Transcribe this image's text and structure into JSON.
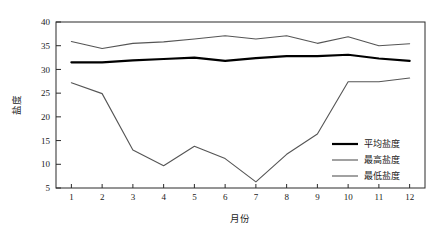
{
  "chart_data": {
    "type": "line",
    "title": "",
    "xlabel": "月份",
    "ylabel": "盐度",
    "x": [
      1,
      2,
      3,
      4,
      5,
      6,
      7,
      8,
      9,
      10,
      11,
      12
    ],
    "xtick_labels": [
      "1",
      "2",
      "3",
      "4",
      "5",
      "6",
      "7",
      "8",
      "9",
      "10",
      "11",
      "12"
    ],
    "ytick_labels": [
      "5",
      "10",
      "15",
      "20",
      "25",
      "30",
      "35",
      "40"
    ],
    "yticks": [
      5,
      10,
      15,
      20,
      25,
      30,
      35,
      40
    ],
    "ylim": [
      5,
      40
    ],
    "xlim": [
      0.5,
      12.5
    ],
    "grid": false,
    "legend_position": "center-right",
    "series": [
      {
        "name": "平均盐度",
        "color": "#000000",
        "width": 2.2,
        "values": [
          31.5,
          31.5,
          31.9,
          32.2,
          32.5,
          31.8,
          32.4,
          32.8,
          32.8,
          33.1,
          32.3,
          31.8
        ]
      },
      {
        "name": "最高盐度",
        "color": "#555555",
        "width": 1.1,
        "values": [
          35.9,
          34.4,
          35.5,
          35.8,
          36.4,
          37.1,
          36.4,
          37.1,
          35.5,
          36.9,
          35.0,
          35.4
        ]
      },
      {
        "name": "最低盐度",
        "color": "#555555",
        "width": 1.1,
        "values": [
          27.2,
          24.9,
          13.0,
          9.7,
          13.8,
          11.2,
          6.3,
          12.1,
          16.4,
          27.4,
          27.4,
          28.2
        ]
      }
    ]
  },
  "legend": {
    "items": [
      {
        "label": "平均盐度"
      },
      {
        "label": "最高盐度"
      },
      {
        "label": "最低盐度"
      }
    ]
  }
}
